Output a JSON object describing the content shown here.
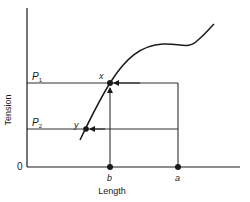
{
  "diagram": {
    "type": "length-tension curve",
    "axes": {
      "y_label": "Tension",
      "x_label": "Length",
      "origin_label": "0"
    },
    "tension_levels": [
      {
        "label_main": "P",
        "label_sub": "1"
      },
      {
        "label_main": "P",
        "label_sub": "2"
      }
    ],
    "points": {
      "x": "x",
      "y": "y",
      "a": "a",
      "b": "b"
    },
    "colors": {
      "line": "#1a1a1a",
      "background": "#ffffff"
    }
  }
}
